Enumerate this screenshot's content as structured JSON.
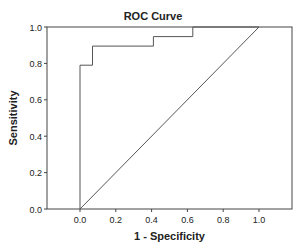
{
  "chart_data": {
    "type": "line",
    "title": "ROC Curve",
    "xlabel": "1 - Specificity",
    "ylabel": "Sensitivity",
    "xlim": [
      -0.18,
      1.18
    ],
    "ylim": [
      0.0,
      1.0
    ],
    "x_ticks": [
      0.0,
      0.2,
      0.4,
      0.6,
      0.8,
      1.0
    ],
    "x_tick_labels": [
      "0.0",
      "0.2",
      "0.4",
      "0.6",
      "0.8",
      "1.0"
    ],
    "y_ticks": [
      0.0,
      0.2,
      0.4,
      0.6,
      0.8,
      1.0
    ],
    "y_tick_labels": [
      "0.0",
      "0.2",
      "0.4",
      "0.6",
      "0.8",
      "1.0"
    ],
    "grid": false,
    "legend": null,
    "series": [
      {
        "name": "ROC",
        "style": "step",
        "x": [
          0.0,
          0.0,
          0.07,
          0.07,
          0.41,
          0.41,
          0.63,
          0.63,
          1.0
        ],
        "y": [
          0.0,
          0.79,
          0.79,
          0.895,
          0.895,
          0.947,
          0.947,
          1.0,
          1.0
        ]
      },
      {
        "name": "Reference Line",
        "style": "line",
        "x": [
          0.0,
          1.0
        ],
        "y": [
          0.0,
          1.0
        ]
      }
    ]
  },
  "colors": {
    "line": "#555555",
    "frame": "#444444",
    "text": "#222222"
  },
  "layout": {
    "plot_left": 47,
    "plot_right": 292,
    "plot_top": 27,
    "plot_bottom": 209,
    "x0_px": 80,
    "x1_px": 259
  }
}
